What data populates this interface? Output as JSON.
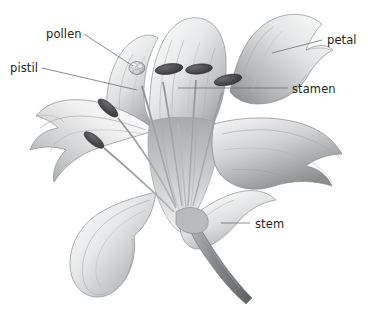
{
  "illustration": {
    "title": "Lily flower anatomy",
    "subject": "lily flower",
    "style": "grayscale pencil shaded botanical illustration",
    "background_color": "#ffffff",
    "ink_color": "#231f20",
    "leader_line_color": "#6d6e71",
    "petal_light": "#fbfbfb",
    "petal_mid": "#d8d9da",
    "petal_shadow": "#9a9b9d",
    "petal_dark": "#76777a",
    "anther_color": "#4a4a4c",
    "stem_color": "#8e9092"
  },
  "labels": [
    {
      "id": "pollen",
      "text": "pollen",
      "text_x": 46,
      "text_y": 38,
      "anchor": "start",
      "leader": "M 84 34 L 133 66",
      "target_part": "stigma"
    },
    {
      "id": "pistil",
      "text": "pistil",
      "text_x": 10,
      "text_y": 72,
      "anchor": "start",
      "leader": "M 42 68 L 137 90",
      "target_part": "pistil-filament"
    },
    {
      "id": "petal",
      "text": "petal",
      "text_x": 327,
      "text_y": 44,
      "anchor": "start",
      "leader": "M 322 40 L 272 53",
      "target_part": "upper-right-petal"
    },
    {
      "id": "stamen",
      "text": "stamen",
      "text_x": 292,
      "text_y": 93,
      "anchor": "start",
      "leader": "M 288 88 L 178 88",
      "target_part": "stamen-filament"
    },
    {
      "id": "stem",
      "text": "stem",
      "text_x": 255,
      "text_y": 228,
      "anchor": "start",
      "leader": "M 250 223 L 221 223",
      "target_part": "stem"
    }
  ],
  "parts": {
    "petals": [
      "upper-left-petal",
      "upper-center-petal",
      "upper-right-petal",
      "left-petal",
      "lower-left-petal",
      "lower-center-petal",
      "right-petal"
    ],
    "stamens_count": 6,
    "pistil_count": 1
  }
}
